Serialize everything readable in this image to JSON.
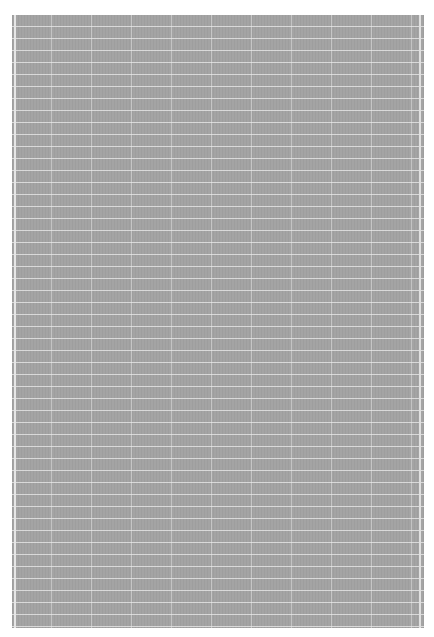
{
  "image": {
    "description": "gray grid texture",
    "colors": {
      "fill": "#a4a4a4",
      "grid_lines": "#ebebeb",
      "background": "#ffffff"
    },
    "grid": {
      "horizontal_spacing_px": 12,
      "vertical_spacing_px": 40
    }
  }
}
